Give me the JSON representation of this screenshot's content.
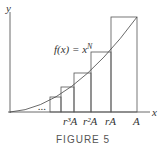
{
  "figure": {
    "caption": "FIGURE 5",
    "function_label": "f(x) = x",
    "function_exponent": "N",
    "axis_x": "x",
    "axis_y": "y",
    "ticks": [
      "r³A",
      "r²A",
      "rA",
      "A"
    ],
    "ellipsis": "..."
  }
}
